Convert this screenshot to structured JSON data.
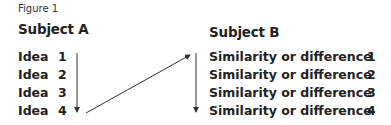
{
  "figure": {
    "label": "Figure 1"
  },
  "subject_a": {
    "title": "Subject A",
    "items": [
      {
        "text": "Idea",
        "num": "1"
      },
      {
        "text": "Idea",
        "num": "2"
      },
      {
        "text": "Idea",
        "num": "3"
      },
      {
        "text": "Idea",
        "num": "4"
      }
    ]
  },
  "subject_b": {
    "title": "Subject B",
    "items": [
      {
        "text": "Similarity or difference",
        "num": "1"
      },
      {
        "text": "Similarity or difference",
        "num": "2"
      },
      {
        "text": "Similarity or difference",
        "num": "3"
      },
      {
        "text": "Similarity or difference",
        "num": "4"
      }
    ]
  },
  "arrows": [
    {
      "name": "down-arrow-subject-a",
      "from": [
        77,
        53
      ],
      "to": [
        77,
        111
      ]
    },
    {
      "name": "diagonal-arrow-a-to-b",
      "from": [
        86,
        113
      ],
      "to": [
        189,
        55
      ]
    },
    {
      "name": "down-arrow-subject-b",
      "from": [
        196,
        53
      ],
      "to": [
        196,
        111
      ]
    }
  ],
  "colors": {
    "text": "#222222",
    "arrow": "#333333",
    "background": "#ffffff"
  }
}
